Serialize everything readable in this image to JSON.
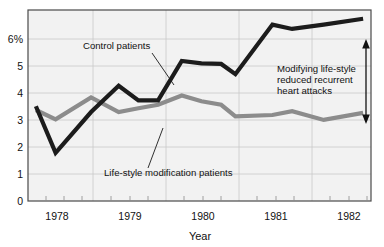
{
  "chart_data": {
    "type": "line",
    "title": "",
    "subtitle": "",
    "xlabel": "Year",
    "ylabel": "",
    "xlim": [
      1977.8,
      1982.15
    ],
    "ylim": [
      0,
      6.55
    ],
    "grid": true,
    "legend_position": "inline-annotations",
    "x_tick_labels": [
      "1978",
      "1979",
      "1980",
      "1981",
      "1982"
    ],
    "x_ticks": [
      1978,
      1979,
      1980,
      1981,
      1982
    ],
    "x_minor_ticks": [
      1978.25,
      1978.5,
      1978.75,
      1979.25,
      1979.5,
      1979.75,
      1980.25,
      1980.5,
      1980.75,
      1981.25,
      1981.5,
      1981.75
    ],
    "y_tick_labels": [
      "0",
      "1",
      "2",
      "3",
      "4",
      "5",
      "6%"
    ],
    "y_ticks": [
      0,
      1,
      2,
      3,
      4,
      5,
      6
    ],
    "y_unit": "%",
    "series": [
      {
        "name": "Control patients",
        "color": "#1c1c1c",
        "x": [
          1977.9,
          1978.15,
          1978.6,
          1978.95,
          1979.2,
          1979.45,
          1979.75,
          1980.0,
          1980.25,
          1980.43,
          1980.9,
          1981.15,
          1981.55,
          1982.05
        ],
        "values": [
          3.25,
          1.65,
          3.05,
          3.95,
          3.45,
          3.45,
          4.8,
          4.72,
          4.7,
          4.35,
          6.05,
          5.9,
          6.05,
          6.25
        ]
      },
      {
        "name": "Life-style modification patients",
        "color": "#8c8c8c",
        "x": [
          1977.9,
          1978.15,
          1978.6,
          1978.95,
          1979.2,
          1979.45,
          1979.75,
          1980.0,
          1980.25,
          1980.43,
          1980.9,
          1981.15,
          1981.55,
          1982.05
        ],
        "values": [
          3.12,
          2.8,
          3.55,
          3.05,
          3.18,
          3.3,
          3.62,
          3.42,
          3.3,
          2.9,
          2.95,
          3.08,
          2.78,
          3.02
        ]
      }
    ],
    "annotations": [
      {
        "id": "control-label",
        "text": "Control patients",
        "text_x": 83,
        "text_y": 49,
        "leader_from_x": 152,
        "leader_from_y": 53,
        "leader_to_x": 174,
        "leader_to_y": 85
      },
      {
        "id": "lifestyle-label",
        "text": "Life-style modification patients",
        "text_x": 104,
        "text_y": 176,
        "leader_from_x": 148,
        "leader_from_y": 168,
        "leader_to_x": 163,
        "leader_to_y": 128
      },
      {
        "id": "gap-callout",
        "lines": [
          "Modifying life-style",
          "reduced recurrent",
          "heart attacks"
        ],
        "text_x": 277,
        "text_y": 74,
        "arrow_x": 366,
        "arrow_top_y": 43,
        "arrow_bottom_y": 120
      }
    ]
  },
  "figure": {
    "plot_area": {
      "left": 28,
      "top": 10,
      "right": 371,
      "bottom": 201
    },
    "background": "#ffffff",
    "plot_background": "#f2f2f2",
    "grid_color": "#c9c9c9",
    "frame_color": "#4a4a4a",
    "axis_title": "Year",
    "y_top_label": "6%"
  }
}
